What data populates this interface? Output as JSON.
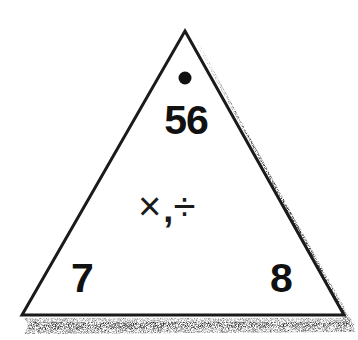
{
  "diagram": {
    "type": "fact-family-triangle",
    "top_value": "56",
    "bottom_left_value": "7",
    "bottom_right_value": "8",
    "operations": {
      "multiply_symbol": "×",
      "separator": ",",
      "divide_symbol": "÷"
    },
    "colors": {
      "stroke": "#1a1a1a",
      "fill": "#ffffff",
      "shadow": "#9a9a9a"
    }
  }
}
